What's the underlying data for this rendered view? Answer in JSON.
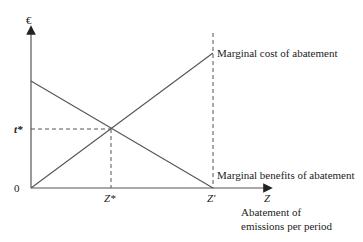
{
  "diagram": {
    "y_axis_label": "€",
    "x_axis_label": "Z",
    "x_axis_title_line1": "Abatement of",
    "x_axis_title_line2": "emissions per period",
    "origin_label": "0",
    "equilibrium_price_label": "t*",
    "equilibrium_quantity_label": "Z*",
    "max_abatement_label": "Z'",
    "curves": [
      {
        "name": "marginal-cost-curve",
        "label": "Marginal cost of abatement",
        "slope": "upward"
      },
      {
        "name": "marginal-benefit-curve",
        "label": "Marginal benefits of abatement",
        "slope": "downward"
      }
    ],
    "colors": {
      "line": "#555555",
      "text": "#222222",
      "background": "#ffffff"
    }
  }
}
